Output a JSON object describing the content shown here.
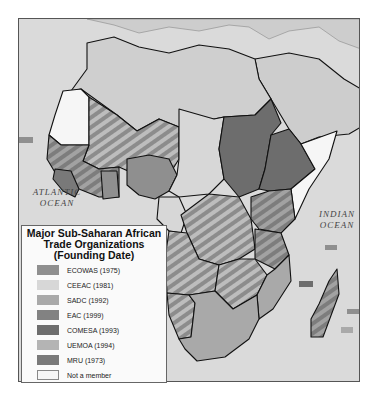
{
  "map": {
    "ocean_labels": {
      "atlantic": [
        "ATLANTIC",
        "OCEAN"
      ],
      "indian": [
        "INDIAN",
        "OCEAN"
      ]
    },
    "colors": {
      "ocean": "#dadada",
      "non_african_land": "#cdcdcd",
      "border": "#111111",
      "hatch_light": "#bdbdbd",
      "hatch_dark": "#8c8c8c"
    },
    "regions": [
      {
        "name": "North Africa",
        "group": "not-shown",
        "fill": "#cfcfcf"
      },
      {
        "name": "Mauritania",
        "group": "Not a member"
      },
      {
        "name": "Sahel ECOWAS/UEMOA",
        "group": "ECOWAS+UEMOA",
        "hatched": true
      },
      {
        "name": "West coast",
        "group": "ECOWAS"
      },
      {
        "name": "Mano River states",
        "group": "MRU"
      },
      {
        "name": "Ghana",
        "group": "ECOWAS"
      },
      {
        "name": "Nigeria",
        "group": "ECOWAS"
      },
      {
        "name": "Chad / CAR / Cameroon",
        "group": "CEEAC"
      },
      {
        "name": "Sudan",
        "group": "COMESA"
      },
      {
        "name": "Ethiopia",
        "group": "COMESA"
      },
      {
        "name": "Somalia",
        "group": "Not a member"
      },
      {
        "name": "DR Congo",
        "group": "CEEAC+SADC",
        "hatched": true
      },
      {
        "name": "Angola",
        "group": "CEEAC+SADC",
        "hatched": true
      },
      {
        "name": "Uganda/Kenya",
        "group": "EAC",
        "hatched": true
      },
      {
        "name": "Tanzania",
        "group": "EAC+SADC",
        "hatched": true
      },
      {
        "name": "Zambia/Zimbabwe",
        "group": "SADC+COMESA",
        "hatched": true
      },
      {
        "name": "Mozambique",
        "group": "SADC"
      },
      {
        "name": "Namibia",
        "group": "SADC",
        "hatched": true
      },
      {
        "name": "South Africa",
        "group": "SADC"
      },
      {
        "name": "Madagascar",
        "group": "SADC+COMESA",
        "hatched": true
      }
    ]
  },
  "legend": {
    "title": [
      "Major Sub-Saharan African",
      "Trade Organizations",
      "(Founding Date)"
    ],
    "items": [
      {
        "label": "ECOWAS (1975)",
        "color": "#8f8f8f"
      },
      {
        "label": "CEEAC (1981)",
        "color": "#d7d7d7"
      },
      {
        "label": "SADC (1992)",
        "color": "#a9a9a9"
      },
      {
        "label": "EAC (1999)",
        "color": "#828282"
      },
      {
        "label": "COMESA (1993)",
        "color": "#6d6d6d"
      },
      {
        "label": "UEMOA (1994)",
        "color": "#b4b4b4"
      },
      {
        "label": "MRU (1973)",
        "color": "#797979"
      },
      {
        "label": "Not a member",
        "color": "#f6f6f6"
      }
    ]
  }
}
